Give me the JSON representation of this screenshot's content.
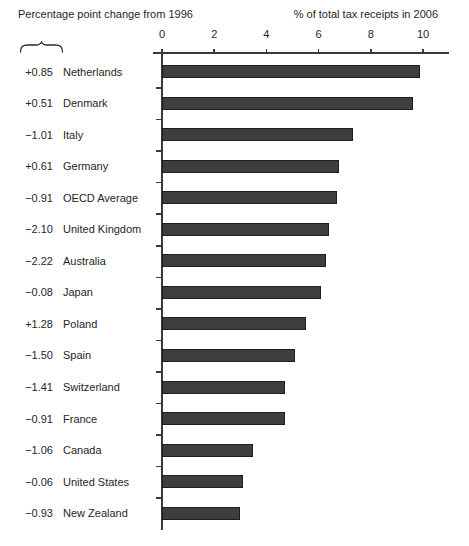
{
  "chart_data": {
    "type": "bar",
    "orientation": "horizontal",
    "left_title": "Percentage point change from 1996",
    "right_title": "% of total tax receipts in 2006",
    "x_axis": {
      "ticks": [
        0,
        2,
        4,
        6,
        8,
        10
      ],
      "range": [
        0,
        11.3
      ],
      "grid": false
    },
    "categories": [
      "Netherlands",
      "Denmark",
      "Italy",
      "Germany",
      "OECD Average",
      "United Kingdom",
      "Australia",
      "Japan",
      "Poland",
      "Spain",
      "Switzerland",
      "France",
      "Canada",
      "United States",
      "New Zealand"
    ],
    "values": [
      9.9,
      9.6,
      7.3,
      6.8,
      6.7,
      6.4,
      6.3,
      6.1,
      5.5,
      5.1,
      4.7,
      4.7,
      3.5,
      3.1,
      3.0
    ],
    "change_labels": [
      "+0.85",
      "+0.51",
      "−1.01",
      "+0.61",
      "−0.91",
      "−2.10",
      "−2.22",
      "−0.08",
      "+1.28",
      "−1.50",
      "−1.41",
      "−0.91",
      "−1.06",
      "−0.06",
      "−0.93"
    ],
    "legend": "none",
    "bar_color": "#3e3e3e",
    "axis_color": "#3a3a3a",
    "text_color": "#1f1f1f"
  }
}
